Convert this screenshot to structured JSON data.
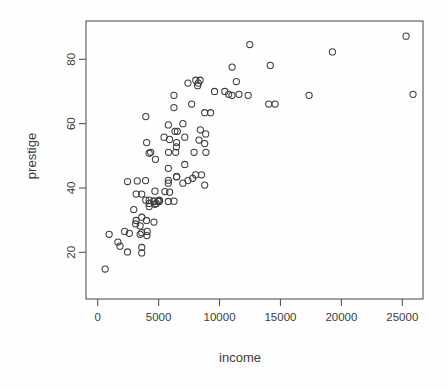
{
  "chart_data": {
    "type": "scatter",
    "title": "",
    "xlabel": "income",
    "ylabel": "prestige",
    "xlim": [
      0,
      26000
    ],
    "ylim": [
      13,
      88
    ],
    "xticks": [
      0,
      5000,
      10000,
      15000,
      20000,
      25000
    ],
    "xticklabels": [
      "0",
      "5000",
      "10000",
      "15000",
      "20000",
      "25000"
    ],
    "yticks": [
      20,
      40,
      60,
      80
    ],
    "yticklabels": [
      "20",
      "40",
      "60",
      "80"
    ],
    "grid": false,
    "legend": null,
    "marker": "open-circle",
    "marker_size_px": 6.2,
    "marker_color": "#3d3d3d",
    "n_points": 102,
    "x": [
      12351,
      25879,
      9271,
      8865,
      8403,
      11030,
      8258,
      14163,
      11377,
      11023,
      14558,
      19263,
      25308,
      17351,
      14032,
      10748,
      8425,
      6336,
      4014,
      8049,
      7405,
      6259,
      9593,
      10432,
      8203,
      3946,
      7716,
      6992,
      7147,
      8880,
      12480,
      11594,
      8780,
      6259,
      5795,
      8316,
      6541,
      5902,
      5813,
      8780,
      6460,
      7909,
      5449,
      6477,
      6403,
      4354,
      8042,
      7147,
      5795,
      6477,
      8516,
      8780,
      7796,
      7405,
      5795,
      5795,
      6992,
      4224,
      4741,
      6477,
      5511,
      5052,
      5902,
      4696,
      5795,
      4945,
      4808,
      3930,
      3247,
      5032,
      6259,
      4224,
      4696,
      4224,
      4224,
      3617,
      3946,
      4614,
      4614,
      5052,
      3617,
      2448,
      3156,
      4616,
      3154,
      2960,
      4004,
      3485,
      3116,
      3485,
      2594,
      4063,
      3617,
      4036,
      2216,
      3617,
      1656,
      1826,
      938,
      2448,
      3617,
      611
    ],
    "y": [
      68.8,
      69.1,
      63.4,
      56.8,
      73.5,
      77.6,
      72.6,
      78.1,
      73.1,
      68.8,
      66.1,
      82.3,
      87.2,
      68.8,
      66.1,
      69.1,
      58.1,
      57.6,
      54.1,
      73.5,
      72.6,
      68.8,
      70.0,
      70.0,
      71.8,
      62.2,
      66.1,
      60.0,
      55.8,
      51.1,
      84.6,
      69.1,
      63.4,
      65.0,
      59.6,
      54.9,
      57.6,
      55.1,
      51.1,
      53.8,
      52.8,
      51.1,
      55.8,
      54.1,
      51.1,
      51.1,
      44.1,
      47.3,
      46.1,
      43.5,
      44.1,
      40.9,
      43.0,
      42.3,
      42.4,
      41.5,
      41.5,
      50.8,
      48.9,
      43.5,
      38.9,
      36.2,
      38.7,
      39.0,
      35.8,
      35.9,
      35.2,
      42.3,
      42.2,
      35.9,
      35.9,
      36.2,
      34.9,
      34.2,
      35.2,
      38.1,
      36.2,
      35.9,
      35.9,
      35.9,
      30.9,
      42.0,
      38.1,
      29.4,
      29.9,
      33.3,
      29.9,
      28.2,
      28.8,
      25.6,
      25.9,
      26.5,
      26.1,
      25.2,
      26.5,
      21.5,
      23.2,
      21.9,
      25.6,
      20.1,
      19.8,
      14.8
    ]
  },
  "axes": {
    "x_axis_name": "income-axis",
    "y_axis_name": "prestige-axis"
  }
}
